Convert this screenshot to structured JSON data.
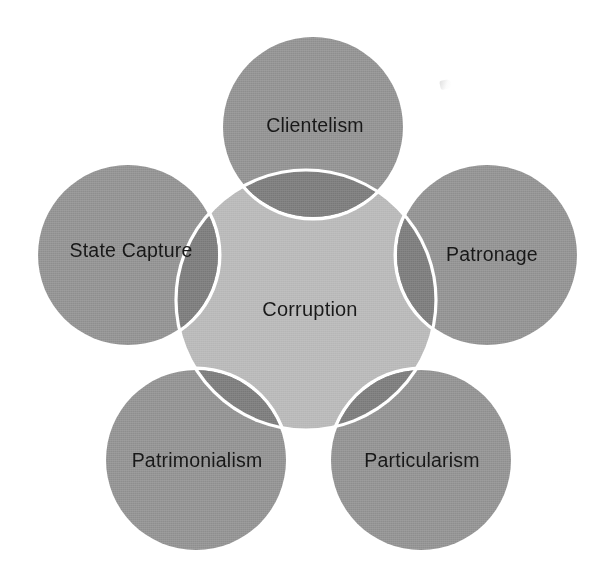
{
  "diagram": {
    "type": "venn-overlap-petal",
    "center": {
      "label": "Corruption",
      "fill": "#b6b6b6",
      "cx": 306,
      "cy": 300,
      "radius": 130
    },
    "petal_fill": "#8e8e8e",
    "overlap_fill": "#787878",
    "outline": "#ffffff",
    "text_color": "#161616",
    "background": "#ffffff",
    "nodes": [
      {
        "id": "clientelism",
        "label": "Clientelism",
        "cx": 313,
        "cy": 127,
        "radius": 90,
        "label_x": 315,
        "label_y": 127
      },
      {
        "id": "patronage",
        "label": "Patronage",
        "cx": 487,
        "cy": 255,
        "radius": 90,
        "label_x": 492,
        "label_y": 256
      },
      {
        "id": "particularism",
        "label": "Particularism",
        "cx": 421,
        "cy": 460,
        "radius": 90,
        "label_x": 422,
        "label_y": 462
      },
      {
        "id": "patrimonialism",
        "label": "Patrimonialism",
        "cx": 196,
        "cy": 460,
        "radius": 90,
        "label_x": 197,
        "label_y": 462
      },
      {
        "id": "state-capture",
        "label": "State Capture",
        "cx": 128,
        "cy": 255,
        "radius": 90,
        "label_x": 131,
        "label_y": 252
      }
    ]
  }
}
